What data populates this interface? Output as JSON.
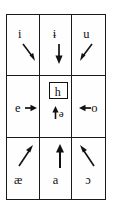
{
  "figure": {
    "grid": {
      "rows": 3,
      "columns": 3,
      "border_color": "#1a1a1a",
      "background": "#ffffff"
    },
    "cells": [
      {
        "position": "top-left",
        "symbol": "i",
        "arrow": "down-right",
        "arrow_name": "arrow-down-right"
      },
      {
        "position": "top-center",
        "symbol": "ɨ",
        "arrow": "down",
        "arrow_name": "arrow-down"
      },
      {
        "position": "top-right",
        "symbol": "u",
        "arrow": "down-left",
        "arrow_name": "arrow-down-left"
      },
      {
        "position": "middle-left",
        "symbol": "e",
        "arrow": "right",
        "arrow_name": "arrow-right"
      },
      {
        "position": "middle-center",
        "symbol": "h",
        "boxed": true,
        "secondary_symbol": "ə",
        "arrow": "up",
        "arrow_name": "arrow-up"
      },
      {
        "position": "middle-right",
        "symbol": "o",
        "arrow": "left",
        "arrow_name": "arrow-left"
      },
      {
        "position": "bottom-left",
        "symbol": "æ",
        "arrow": "up-right",
        "arrow_name": "arrow-up-right"
      },
      {
        "position": "bottom-center",
        "symbol": "a",
        "arrow": "up",
        "arrow_name": "arrow-up"
      },
      {
        "position": "bottom-right",
        "symbol": "ɔ",
        "arrow": "up-left",
        "arrow_name": "arrow-up-left"
      }
    ],
    "colors": {
      "ink": "#111111",
      "rule": "#1a1a1a",
      "paper": "#ffffff"
    }
  }
}
